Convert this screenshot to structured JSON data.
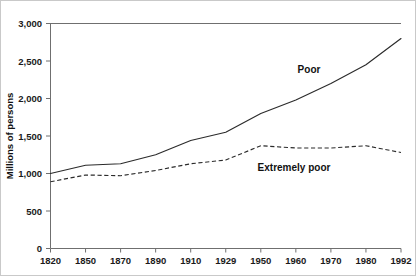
{
  "chart_data": {
    "type": "line",
    "title": "",
    "xlabel": "",
    "ylabel": "Millions of persons",
    "categories": [
      "1820",
      "1850",
      "1870",
      "1890",
      "1910",
      "1929",
      "1950",
      "1960",
      "1970",
      "1980",
      "1992"
    ],
    "ylim": [
      0,
      3000
    ],
    "yticks": [
      0,
      500,
      1000,
      1500,
      2000,
      2500,
      3000
    ],
    "ytick_labels": [
      "0",
      "500",
      "1,000",
      "1,500",
      "2,000",
      "2,500",
      "3,000"
    ],
    "grid": false,
    "legend_position": "inline-annotations",
    "series": [
      {
        "name": "Poor",
        "style": "solid",
        "color": "#2b2b2b",
        "values": [
          1000,
          1110,
          1130,
          1250,
          1440,
          1550,
          1800,
          1980,
          2200,
          2450,
          2800
        ]
      },
      {
        "name": "Extremely poor",
        "style": "dashed",
        "color": "#2b2b2b",
        "values": [
          890,
          980,
          970,
          1040,
          1130,
          1180,
          1370,
          1340,
          1340,
          1370,
          1280
        ]
      }
    ],
    "annotations": [
      {
        "text": "Poor",
        "x_px": 308,
        "y_px": 72
      },
      {
        "text": "Extremely poor",
        "x_px": 293,
        "y_px": 170
      }
    ]
  },
  "axes": {
    "y_axis_name": "y-axis",
    "x_axis_name": "x-axis"
  }
}
